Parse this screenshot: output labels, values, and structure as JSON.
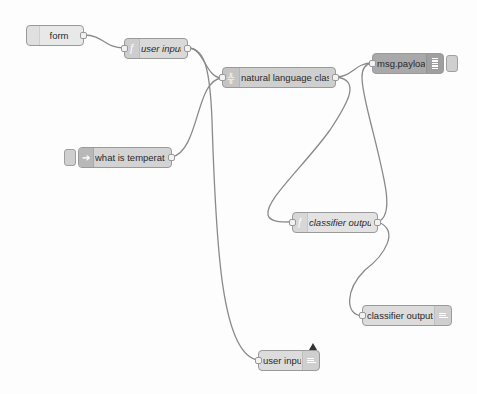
{
  "editor": {
    "theme_colors": {
      "canvas": "#fdfdfd",
      "wire": "#8a8a8a",
      "node_border": "#9a9a9a"
    }
  },
  "nodes": [
    {
      "id": "form",
      "label": "form",
      "type": "input",
      "icon": "globe-icon",
      "italic": false,
      "color": "#e6e6e6"
    },
    {
      "id": "user_input_fn",
      "label": "user input",
      "type": "function",
      "icon": "function-icon",
      "italic": true,
      "color": "#d8d8d8"
    },
    {
      "id": "nlc",
      "label": "natural language classifier",
      "type": "watson",
      "icon": "classifier-icon",
      "italic": false,
      "color": "#cfcfcf"
    },
    {
      "id": "msg_payload",
      "label": "msg.payload",
      "type": "debug",
      "icon": "debug-icon",
      "italic": false,
      "color": "#a8a8a8"
    },
    {
      "id": "what_is_temp",
      "label": "what is temperature",
      "type": "inject",
      "icon": "inject-icon",
      "italic": false,
      "color": "#d4d4d4"
    },
    {
      "id": "classifier_output_fn",
      "label": "classifier output",
      "type": "function",
      "icon": "function-icon",
      "italic": true,
      "color": "#e2e2e2"
    },
    {
      "id": "classifier_output_ui",
      "label": "classifier output",
      "type": "ui-text",
      "icon": "text-icon",
      "italic": false,
      "color": "#dcdcdc"
    },
    {
      "id": "user_input_ui",
      "label": "user input",
      "type": "ui-text",
      "icon": "text-icon",
      "italic": false,
      "color": "#dcdcdc",
      "changed": true
    }
  ]
}
